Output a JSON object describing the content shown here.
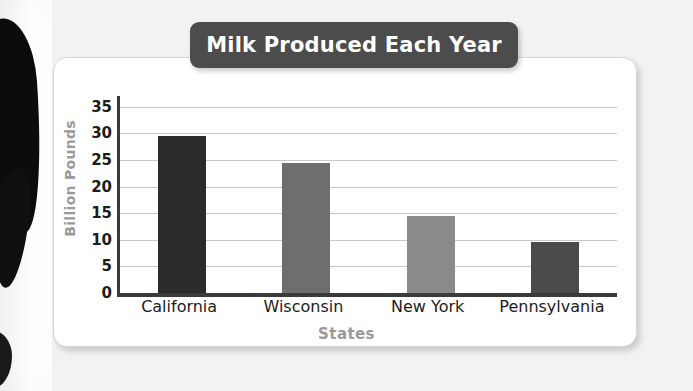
{
  "chart_data": {
    "type": "bar",
    "title": "Milk Produced Each Year",
    "xlabel": "States",
    "ylabel": "Billion Pounds",
    "categories": [
      "California",
      "Wisconsin",
      "New York",
      "Pennsylvania"
    ],
    "values": [
      29.5,
      24.5,
      14.5,
      9.5
    ],
    "bar_colors": [
      "#2b2b2b",
      "#6e6e6e",
      "#8a8a8a",
      "#4a4a4a"
    ],
    "ylim": [
      0,
      37
    ],
    "yticks": [
      0,
      5,
      10,
      15,
      20,
      25,
      30,
      35
    ],
    "ytick_labels": [
      "0",
      "5",
      "10",
      "15",
      "20",
      "25",
      "30",
      "35"
    ],
    "grid": true,
    "legend": "none"
  },
  "style": {
    "title_banner_color": "#4c4c4c",
    "title_text_color": "#ffffff",
    "axis_title_color": "#9a9a9a",
    "page_background": "#f2f2f2",
    "card_background": "#ffffff",
    "gridline_color": "#c9c9c9",
    "axis_color": "#3a3a3a"
  },
  "decoration": {
    "cow_photo_label": "cow-photo"
  }
}
